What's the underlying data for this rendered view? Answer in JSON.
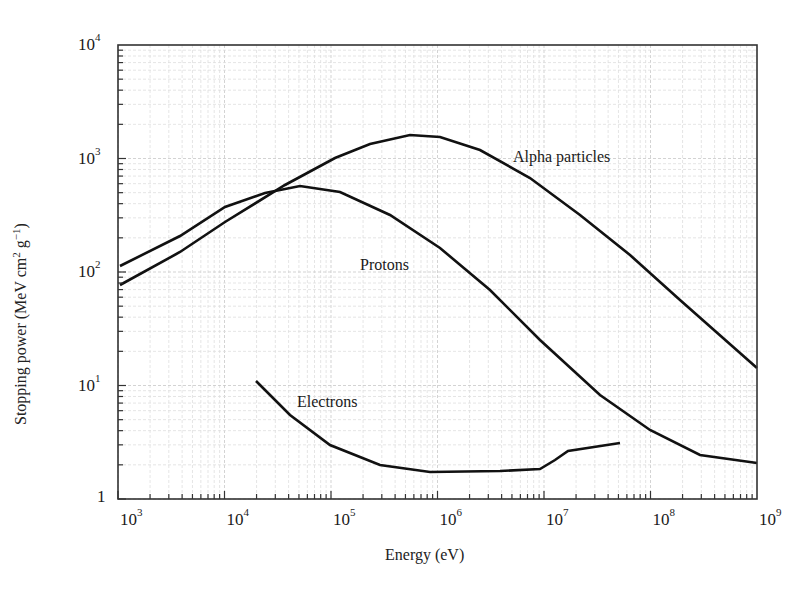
{
  "chart_data": {
    "type": "line",
    "title": "",
    "xlabel": "Energy (eV)",
    "ylabel": "Stopping power (MeV cm^2 g^-1)",
    "xscale": "log",
    "yscale": "log",
    "xlim": [
      1000,
      1000000000
    ],
    "ylim": [
      1,
      10000
    ],
    "grid": true,
    "x_ticks": [
      "10^3",
      "10^4",
      "10^5",
      "10^6",
      "10^7",
      "10^8",
      "10^9"
    ],
    "y_ticks": [
      "1",
      "10^1",
      "10^2",
      "10^3",
      "10^4"
    ],
    "series": [
      {
        "name": "Alpha particles",
        "x": [
          1000,
          3500,
          9000,
          36000,
          110000,
          230000,
          550000,
          1000000,
          2400000,
          7000000,
          20000000,
          60000000,
          180000000,
          1000000000
        ],
        "y": [
          75,
          150,
          270,
          570,
          1000,
          1300,
          1600,
          1550,
          1200,
          720,
          330,
          160,
          66,
          14
        ]
      },
      {
        "name": "Protons",
        "x": [
          1000,
          3500,
          9000,
          22000,
          45000,
          110000,
          330000,
          1000000,
          2900000,
          8600000,
          31000000,
          90000000,
          260000000,
          1000000000
        ],
        "y": [
          110,
          205,
          375,
          500,
          580,
          520,
          320,
          160,
          70,
          26,
          8.5,
          4.2,
          2.5,
          2.1
        ]
      },
      {
        "name": "Electrons",
        "x": [
          16000,
          33000,
          80000,
          250000,
          750000,
          3500000,
          8000000,
          11000000,
          13000000,
          50000000
        ],
        "y": [
          11,
          5.3,
          2.8,
          1.9,
          1.7,
          1.75,
          1.8,
          2.2,
          2.7,
          3.1
        ]
      }
    ],
    "annotations": [
      "Alpha particles",
      "Protons",
      "Electrons"
    ]
  },
  "labels": {
    "xlabel": "Energy (eV)",
    "ylabel_main": "Stopping power (MeV cm",
    "ylabel_sup1": "2",
    "ylabel_mid": " g",
    "ylabel_sup2": "−1",
    "ylabel_end": ")",
    "alpha": "Alpha particles",
    "protons": "Protons",
    "electrons": "Electrons"
  },
  "ticks": {
    "x": [
      {
        "base": "10",
        "exp": "3"
      },
      {
        "base": "10",
        "exp": "4"
      },
      {
        "base": "10",
        "exp": "5"
      },
      {
        "base": "10",
        "exp": "6"
      },
      {
        "base": "10",
        "exp": "7"
      },
      {
        "base": "10",
        "exp": "8"
      },
      {
        "base": "10",
        "exp": "9"
      }
    ],
    "y": [
      {
        "base": "1",
        "exp": ""
      },
      {
        "base": "10",
        "exp": "1"
      },
      {
        "base": "10",
        "exp": "2"
      },
      {
        "base": "10",
        "exp": "3"
      },
      {
        "base": "10",
        "exp": "4"
      }
    ]
  }
}
